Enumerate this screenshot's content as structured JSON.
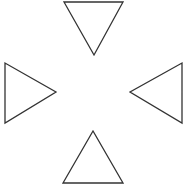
{
  "diagram": {
    "background": "#ffffff",
    "stroke_color": "#333333",
    "fill_color": "#ffffff",
    "stroke_width": 1.3,
    "shapes": [
      {
        "name": "top-triangle",
        "direction": "down",
        "points": "64,2 123,2 94,55"
      },
      {
        "name": "left-triangle",
        "direction": "right",
        "points": "5,63 5,123 56,92"
      },
      {
        "name": "right-triangle",
        "direction": "left",
        "points": "182,63 182,123 130,92"
      },
      {
        "name": "bottom-triangle",
        "direction": "up",
        "points": "93,131 63,183 123,183"
      }
    ]
  }
}
